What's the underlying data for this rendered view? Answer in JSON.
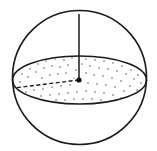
{
  "figure": {
    "width": 157,
    "height": 151,
    "background": "#ffffff",
    "stroke_color": "#1a1a1a",
    "sphere": {
      "cx": 79.5,
      "cy": 77.5,
      "r": 67
    },
    "equator_disk": {
      "cx": 79.5,
      "cy": 80,
      "rx": 67,
      "ry": 24,
      "fill": "stippled"
    },
    "vertical_radius": {
      "x1": 79,
      "y1": 14,
      "x2": 79,
      "y2": 80,
      "style": "solid"
    },
    "horizontal_radius": {
      "x1": 79,
      "y1": 80,
      "x2": 14,
      "y2": 88,
      "style": "dashed"
    },
    "center_point": {
      "cx": 79,
      "cy": 80,
      "r": 2.6
    }
  }
}
